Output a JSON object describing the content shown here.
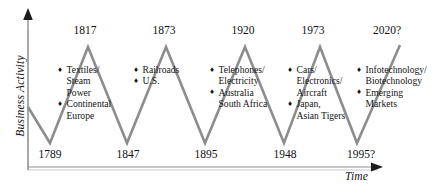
{
  "chart_data": {
    "type": "line",
    "title": "",
    "xlabel": "Time",
    "ylabel": "Business Activity",
    "grid": false,
    "legend": "none",
    "series": [
      {
        "name": "Kondratiev wave",
        "points": [
          {
            "x": 1789,
            "y": "trough",
            "px": 50,
            "py": 143
          },
          {
            "x": 1817,
            "y": "peak",
            "px": 88,
            "py": 47
          },
          {
            "x": 1847,
            "y": "trough",
            "px": 127,
            "py": 143
          },
          {
            "x": 1873,
            "y": "peak",
            "px": 166,
            "py": 47
          },
          {
            "x": 1895,
            "y": "trough",
            "px": 205,
            "py": 143
          },
          {
            "x": 1920,
            "y": "peak",
            "px": 245,
            "py": 47
          },
          {
            "x": 1948,
            "y": "trough",
            "px": 284,
            "py": 143
          },
          {
            "x": 1973,
            "y": "peak",
            "px": 320,
            "py": 47
          },
          {
            "x": 1995,
            "y": "trough",
            "px": 357,
            "py": 143
          },
          {
            "x": 2020,
            "y": "peak",
            "px": 400,
            "py": 45
          }
        ]
      }
    ],
    "peak_labels": [
      "1817",
      "1873",
      "1920",
      "1973",
      "2020?"
    ],
    "trough_labels": [
      "1789",
      "1847",
      "1895",
      "1948",
      "1995?"
    ],
    "wave_color": "#8d8d8d",
    "axis_color": "#9b9b9b"
  },
  "axes": {
    "y_label": "Business Activity",
    "x_label": "Time"
  },
  "peaks": [
    {
      "year": "1817",
      "x": 85
    },
    {
      "year": "1873",
      "x": 164
    },
    {
      "year": "1920",
      "x": 243
    },
    {
      "year": "1973",
      "x": 313
    },
    {
      "year": "2020?",
      "x": 387
    }
  ],
  "troughs": [
    {
      "year": "1789",
      "x": 50
    },
    {
      "year": "1847",
      "x": 128
    },
    {
      "year": "1895",
      "x": 206
    },
    {
      "year": "1948",
      "x": 285
    },
    {
      "year": "1995?",
      "x": 361
    }
  ],
  "annotations": [
    {
      "id": "wave-1",
      "x": 58,
      "y": 64,
      "items": [
        {
          "bullet": "diamond-bullet-icon",
          "lines": [
            "Textiles/",
            "Steam",
            "Power"
          ]
        },
        {
          "bullet": "diamond-bullet-icon",
          "lines": [
            "Continental",
            "Europe"
          ]
        }
      ]
    },
    {
      "id": "wave-2",
      "x": 134,
      "y": 64,
      "items": [
        {
          "bullet": "diamond-bullet-icon",
          "lines": [
            "Railroads"
          ]
        },
        {
          "bullet": "diamond-bullet-icon",
          "lines": [
            "U.S."
          ]
        }
      ]
    },
    {
      "id": "wave-3",
      "x": 210,
      "y": 64,
      "items": [
        {
          "bullet": "diamond-bullet-icon",
          "lines": [
            "Telephones/",
            "Electricity"
          ]
        },
        {
          "bullet": "diamond-bullet-icon",
          "lines": [
            "Australia",
            "South Africa"
          ]
        }
      ]
    },
    {
      "id": "wave-4",
      "x": 288,
      "y": 64,
      "items": [
        {
          "bullet": "diamond-bullet-icon",
          "lines": [
            "Cars/",
            "Electronics/",
            "Aircraft"
          ]
        },
        {
          "bullet": "diamond-bullet-icon",
          "lines": [
            "Japan,",
            "Asian Tigers"
          ]
        }
      ]
    },
    {
      "id": "wave-5",
      "x": 357,
      "y": 64,
      "items": [
        {
          "bullet": "diamond-bullet-icon",
          "lines": [
            "Infotechnology/",
            "Biotechnology"
          ]
        },
        {
          "bullet": "diamond-bullet-icon",
          "lines": [
            "Emerging",
            "Markets"
          ]
        }
      ]
    }
  ],
  "icons": {
    "bullet_glyph": "♦",
    "y_axis_arrow": "up-arrow-icon",
    "x_axis_arrow": "right-arrow-icon"
  }
}
